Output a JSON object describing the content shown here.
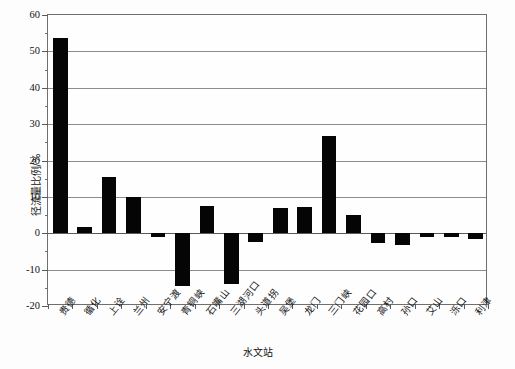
{
  "chart_data": {
    "type": "bar",
    "title": "",
    "subtitle": "",
    "xlabel": "水文站",
    "ylabel": "径流量比例/%",
    "ylim": [
      -20,
      60
    ],
    "ytick_step": 10,
    "yticks": [
      60,
      50,
      40,
      30,
      20,
      10,
      0,
      -10,
      -20
    ],
    "ytick_labels": [
      "60",
      "50",
      "40",
      "30",
      "20",
      "10",
      "0",
      "-10",
      "-20"
    ],
    "grid": "horizontal",
    "legend": "none",
    "bar_color": "#050505",
    "categories": [
      "贵德",
      "循化",
      "上诠",
      "兰州",
      "安宁渡",
      "青铜峡",
      "石嘴山",
      "三湖河口",
      "头道拐",
      "吴堡",
      "龙门",
      "三门峡",
      "花园口",
      "高村",
      "孙口",
      "艾山",
      "泺口",
      "利津"
    ],
    "values": [
      53.8,
      1.8,
      15.5,
      9.9,
      -1.1,
      -14.5,
      7.5,
      -14.0,
      -2.3,
      7.0,
      7.2,
      26.6,
      4.9,
      -2.6,
      -3.3,
      -0.9,
      -1.1,
      -1.5
    ],
    "series": [
      {
        "name": "径流量比例",
        "values": [
          53.8,
          1.8,
          15.5,
          9.9,
          -1.1,
          -14.5,
          7.5,
          -14.0,
          -2.3,
          7.0,
          7.2,
          26.6,
          4.9,
          -2.6,
          -3.3,
          -0.9,
          -1.1,
          -1.5
        ]
      }
    ],
    "annotations": []
  }
}
